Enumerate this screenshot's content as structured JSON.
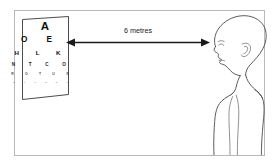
{
  "figure": {
    "background_color": "#ffffff",
    "frame_color": "#b9b9b9",
    "ink_color": "#1a1a1a",
    "outline_color": "#4a4a4a"
  },
  "measurement": {
    "label": "6 metres",
    "value": "6",
    "unit": "metres",
    "arrow_style": "double-headed"
  },
  "eye_chart": {
    "name": "Snellen chart",
    "board_color": "#ffffff",
    "border_color": "#4c4c4c",
    "rows": [
      {
        "letters": "A",
        "font_size": 11.5,
        "spacing": 0,
        "opacity": 1.0
      },
      {
        "letters": "O E",
        "font_size": 8.2,
        "spacing": 8.5,
        "opacity": 1.0
      },
      {
        "letters": "H L K",
        "font_size": 6.2,
        "spacing": 7.5,
        "opacity": 1.0
      },
      {
        "letters": "N T C O",
        "font_size": 4.6,
        "spacing": 6.2,
        "opacity": 0.95
      },
      {
        "letters": "R O T U X",
        "font_size": 3.4,
        "spacing": 5.2,
        "opacity": 0.78
      },
      {
        "letters": "Z F H N D P",
        "font_size": 2.3,
        "spacing": 4.2,
        "opacity": 0.5
      }
    ]
  },
  "person": {
    "name": "patient",
    "view": "left-facing profile",
    "parts": [
      "head",
      "face",
      "ear",
      "neck",
      "shoulder",
      "arm",
      "torso"
    ]
  }
}
